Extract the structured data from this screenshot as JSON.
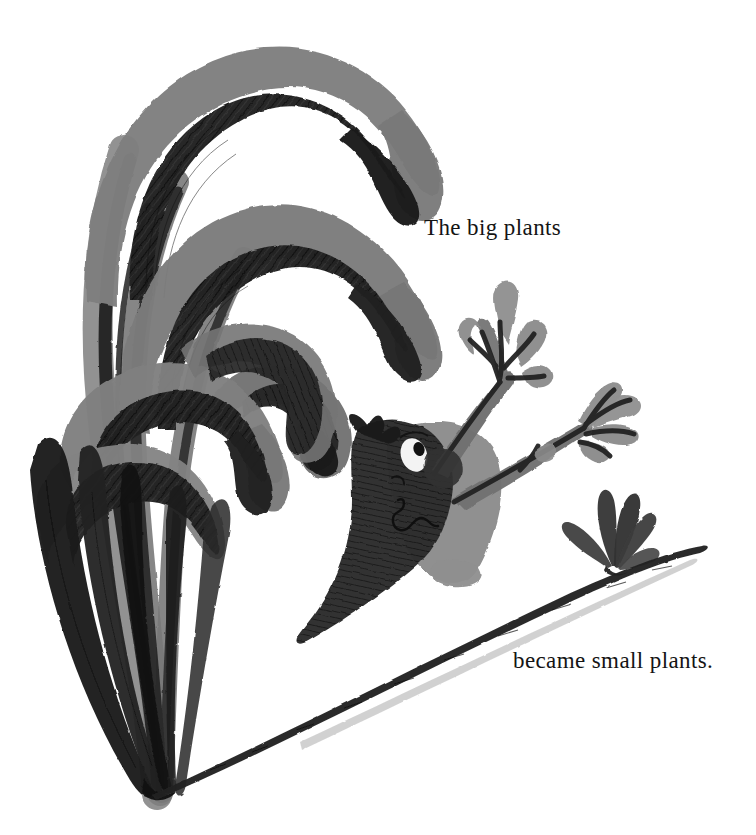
{
  "page": {
    "width": 756,
    "height": 835,
    "background_color": "#ffffff",
    "medium": "ink-and-wash-illustration"
  },
  "captions": {
    "top": {
      "text": "The big plants",
      "x": 424,
      "y": 215,
      "color": "#141414",
      "font_size_px": 23
    },
    "bottom": {
      "text": "became small plants.",
      "x": 513,
      "y": 648,
      "color": "#141414",
      "font_size_px": 23
    }
  },
  "palette": {
    "background": "#ffffff",
    "wash_gray": "#7c7c7c",
    "wash_gray_light": "#8d8d8d",
    "ink_dark": "#262626",
    "ink_black": "#141414",
    "ink_mid": "#3a3a3a",
    "eye_white": "#f4f4f4"
  },
  "artwork": {
    "title": "Big drooping plants with a creature, and one small sprout",
    "elements": [
      {
        "name": "big-plant-cluster",
        "description": "Tall arcing leaves with gray wash outer edge and dark cross-hatched inner half, drooping over from upper left",
        "leaf_count": 6,
        "base_point": {
          "x": 157,
          "y": 792
        }
      },
      {
        "name": "creature",
        "description": "Dark hatched figure with single white eye, torso in gray wash, two branching arms raised to upper right",
        "eye": {
          "x": 414,
          "y": 455
        },
        "arm_count": 2
      },
      {
        "name": "small-plant",
        "description": "Small sprout with five dark pointed leaves on the ground line at right",
        "x": 612,
        "y": 560,
        "leaf_count": 5
      },
      {
        "name": "ground-line",
        "description": "Single long tapering ink stroke sweeping from lower left up to the right horizon",
        "from": {
          "x": 152,
          "y": 795
        },
        "to": {
          "x": 700,
          "y": 548
        }
      }
    ]
  }
}
